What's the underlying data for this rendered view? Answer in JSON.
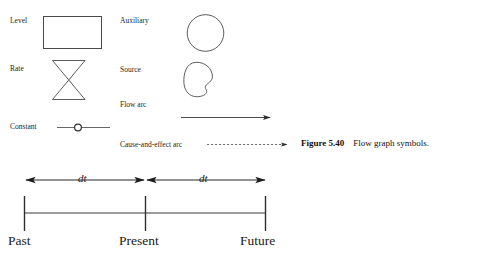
{
  "figure": {
    "caption_number": "Figure 5.40",
    "caption_text": "Flow graph symbols."
  },
  "legend": {
    "left_column": [
      {
        "label": "Level",
        "symbol": "rectangle-shape"
      },
      {
        "label": "Rate",
        "symbol": "hourglass-valve-shape"
      },
      {
        "label": "Constant",
        "symbol": "line-with-circle-shape"
      }
    ],
    "right_column": [
      {
        "label": "Auxiliary",
        "symbol": "circle-shape"
      },
      {
        "label": "Source",
        "symbol": "cloud-bean-shape"
      },
      {
        "label": "Flow  arc",
        "symbol": "solid-arrow"
      },
      {
        "label": "Cause-and-effect arc",
        "symbol": "dashed-arrow"
      }
    ]
  },
  "timeline": {
    "interval_label_left": "dt",
    "interval_label_right": "dt",
    "ticks": [
      {
        "label": "Past"
      },
      {
        "label": "Present"
      },
      {
        "label": "Future"
      }
    ]
  },
  "colors": {
    "ink": "#231f20",
    "line": "#3a3a3a",
    "background": "#ffffff"
  }
}
